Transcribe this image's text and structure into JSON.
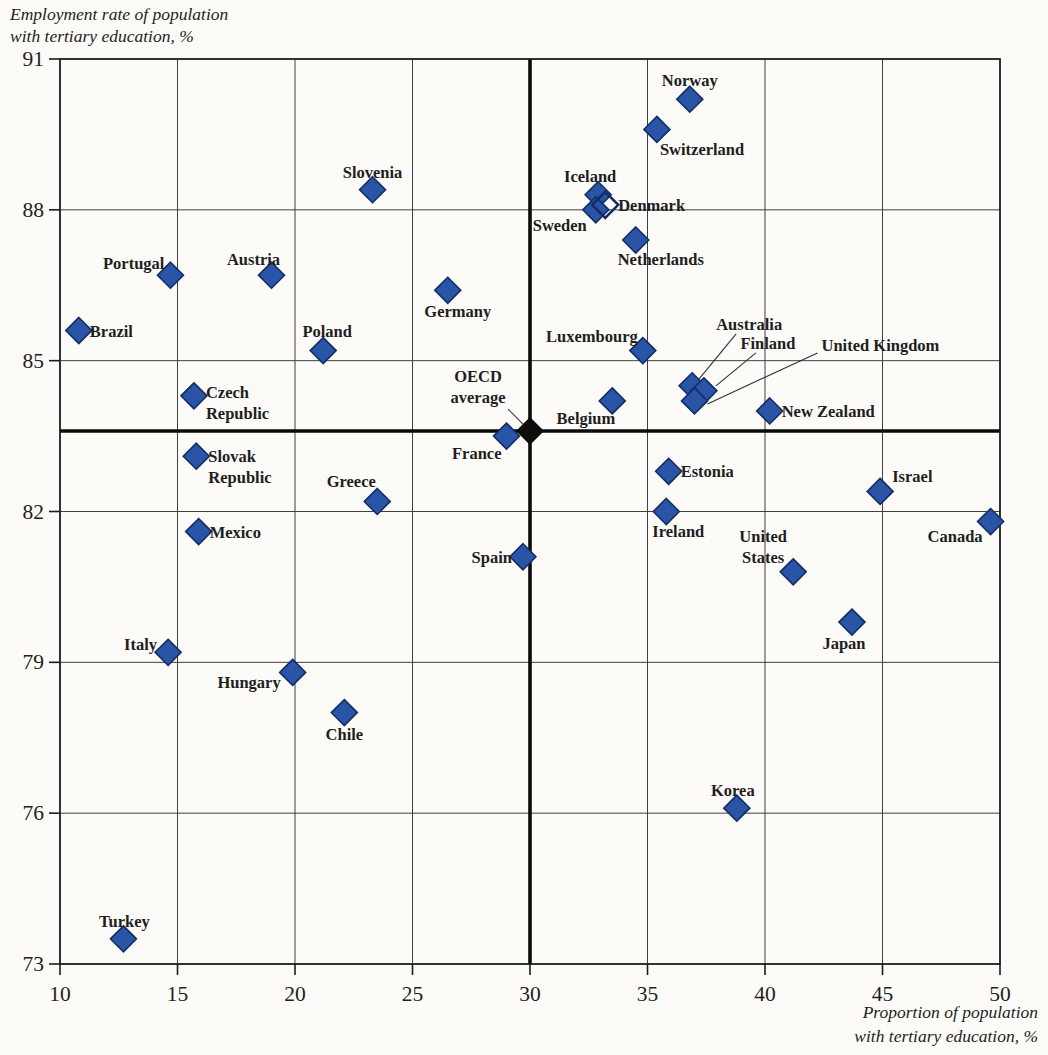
{
  "figure": {
    "background": "#fcfbf7"
  },
  "chart_data": {
    "type": "scatter",
    "title": "",
    "xlabel": "Proportion of population with tertiary education, %",
    "ylabel": "Employment rate of population with tertiary education, %",
    "x_axis_title_lines": [
      "Proportion of population",
      "with tertiary education, %"
    ],
    "y_axis_title_lines": [
      "Employment rate of population",
      "with tertiary education, %"
    ],
    "xlim": [
      10,
      50
    ],
    "ylim": [
      73,
      91
    ],
    "x_ticks": [
      10,
      15,
      20,
      25,
      30,
      35,
      40,
      45,
      50
    ],
    "y_ticks": [
      73,
      76,
      79,
      82,
      85,
      88,
      91
    ],
    "grid": true,
    "legend": "none",
    "reference_point": {
      "name": "OECD average",
      "x": 30,
      "y": 83.6,
      "marker": "black",
      "label": {
        "lines": [
          "OECD",
          "average"
        ],
        "anchor": "middle",
        "dx": -52,
        "dy": -49,
        "bold": true
      },
      "leader": [
        [
          -22,
          -22
        ],
        [
          -5,
          -5
        ]
      ]
    },
    "points": [
      {
        "name": "Brazil",
        "x": 10.8,
        "y": 85.6,
        "marker": "filled",
        "label": {
          "lines": [
            "Brazil"
          ],
          "anchor": "start",
          "dx": 11,
          "dy": 6
        }
      },
      {
        "name": "Turkey",
        "x": 12.7,
        "y": 73.5,
        "marker": "filled",
        "label": {
          "lines": [
            "Turkey"
          ],
          "anchor": "middle",
          "dx": 1,
          "dy": -12
        }
      },
      {
        "name": "Italy",
        "x": 14.6,
        "y": 79.2,
        "marker": "filled",
        "label": {
          "lines": [
            "Italy"
          ],
          "anchor": "end",
          "dx": -11,
          "dy": -2
        }
      },
      {
        "name": "Portugal",
        "x": 14.7,
        "y": 86.7,
        "marker": "filled",
        "label": {
          "lines": [
            "Portugal"
          ],
          "anchor": "end",
          "dx": -6,
          "dy": -6
        }
      },
      {
        "name": "Czech Republic",
        "x": 15.7,
        "y": 84.3,
        "marker": "filled",
        "label": {
          "lines": [
            "Czech",
            "Republic"
          ],
          "anchor": "start",
          "dx": 12,
          "dy": 2
        }
      },
      {
        "name": "Slovak Republic",
        "x": 15.8,
        "y": 83.1,
        "marker": "filled",
        "label": {
          "lines": [
            "Slovak",
            "Republic"
          ],
          "anchor": "start",
          "dx": 12,
          "dy": 6
        }
      },
      {
        "name": "Mexico",
        "x": 15.9,
        "y": 81.6,
        "marker": "filled",
        "label": {
          "lines": [
            "Mexico"
          ],
          "anchor": "start",
          "dx": 11,
          "dy": 6
        }
      },
      {
        "name": "Austria",
        "x": 19.0,
        "y": 86.7,
        "marker": "filled",
        "label": {
          "lines": [
            "Austria"
          ],
          "anchor": "middle",
          "dx": -18,
          "dy": -10
        }
      },
      {
        "name": "Hungary",
        "x": 19.9,
        "y": 78.8,
        "marker": "filled",
        "label": {
          "lines": [
            "Hungary"
          ],
          "anchor": "end",
          "dx": -12,
          "dy": 16
        }
      },
      {
        "name": "Poland",
        "x": 21.2,
        "y": 85.2,
        "marker": "filled",
        "label": {
          "lines": [
            "Poland"
          ],
          "anchor": "middle",
          "dx": 4,
          "dy": -14
        }
      },
      {
        "name": "Chile",
        "x": 22.1,
        "y": 78.0,
        "marker": "filled",
        "label": {
          "lines": [
            "Chile"
          ],
          "anchor": "middle",
          "dx": 0,
          "dy": 27
        }
      },
      {
        "name": "Slovenia",
        "x": 23.3,
        "y": 88.4,
        "marker": "filled",
        "label": {
          "lines": [
            "Slovenia"
          ],
          "anchor": "middle",
          "dx": 0,
          "dy": -12
        }
      },
      {
        "name": "Greece",
        "x": 23.5,
        "y": 82.2,
        "marker": "filled",
        "label": {
          "lines": [
            "Greece"
          ],
          "anchor": "middle",
          "dx": -26,
          "dy": -14
        }
      },
      {
        "name": "Germany",
        "x": 26.5,
        "y": 86.4,
        "marker": "filled",
        "label": {
          "lines": [
            "Germany"
          ],
          "anchor": "middle",
          "dx": 10,
          "dy": 27
        }
      },
      {
        "name": "France",
        "x": 29.0,
        "y": 83.5,
        "marker": "filled",
        "label": {
          "lines": [
            "France"
          ],
          "anchor": "end",
          "dx": -5,
          "dy": 23
        }
      },
      {
        "name": "Spain",
        "x": 29.7,
        "y": 81.1,
        "marker": "filled",
        "label": {
          "lines": [
            "Spain"
          ],
          "anchor": "end",
          "dx": -11,
          "dy": 6
        }
      },
      {
        "name": "Iceland",
        "x": 32.9,
        "y": 88.3,
        "marker": "filled",
        "label": {
          "lines": [
            "Iceland"
          ],
          "anchor": "middle",
          "dx": -8,
          "dy": -13
        }
      },
      {
        "name": "Sweden",
        "x": 32.8,
        "y": 88.0,
        "marker": "filled",
        "label": {
          "lines": [
            "Sweden"
          ],
          "anchor": "end",
          "dx": -9,
          "dy": 21
        }
      },
      {
        "name": "Denmark",
        "x": 33.2,
        "y": 88.1,
        "marker": "open",
        "label": {
          "lines": [
            "Denmark"
          ],
          "anchor": "start",
          "dx": 13,
          "dy": 6
        }
      },
      {
        "name": "Belgium",
        "x": 33.5,
        "y": 84.2,
        "marker": "filled",
        "label": {
          "lines": [
            "Belgium"
          ],
          "anchor": "end",
          "dx": 3,
          "dy": 23
        }
      },
      {
        "name": "Netherlands",
        "x": 34.5,
        "y": 87.4,
        "marker": "filled",
        "label": {
          "lines": [
            "Netherlands"
          ],
          "anchor": "middle",
          "dx": 25,
          "dy": 25
        }
      },
      {
        "name": "Luxembourg",
        "x": 34.8,
        "y": 85.2,
        "marker": "filled",
        "label": {
          "lines": [
            "Luxembourg"
          ],
          "anchor": "end",
          "dx": -5,
          "dy": -9
        }
      },
      {
        "name": "Switzerland",
        "x": 35.4,
        "y": 89.6,
        "marker": "filled",
        "label": {
          "lines": [
            "Switzerland"
          ],
          "anchor": "start",
          "dx": 3,
          "dy": 26
        }
      },
      {
        "name": "Estonia",
        "x": 35.9,
        "y": 82.8,
        "marker": "filled",
        "label": {
          "lines": [
            "Estonia"
          ],
          "anchor": "start",
          "dx": 12,
          "dy": 6
        }
      },
      {
        "name": "Ireland",
        "x": 35.8,
        "y": 82.0,
        "marker": "filled",
        "label": {
          "lines": [
            "Ireland"
          ],
          "anchor": "middle",
          "dx": 12,
          "dy": 25
        }
      },
      {
        "name": "Norway",
        "x": 36.8,
        "y": 90.2,
        "marker": "filled",
        "label": {
          "lines": [
            "Norway"
          ],
          "anchor": "middle",
          "dx": 0,
          "dy": -13
        }
      },
      {
        "name": "Australia",
        "x": 36.9,
        "y": 84.5,
        "marker": "filled",
        "label": {
          "lines": [
            "Australia"
          ],
          "anchor": "middle",
          "dx": 57,
          "dy": -56
        },
        "leader": [
          [
            44,
            -52
          ],
          [
            7,
            -7
          ]
        ]
      },
      {
        "name": "Finland",
        "x": 37.4,
        "y": 84.4,
        "marker": "filled",
        "label": {
          "lines": [
            "Finland"
          ],
          "anchor": "middle",
          "dx": 64,
          "dy": -42
        },
        "leader": [
          [
            52,
            -38
          ],
          [
            12,
            -5
          ]
        ]
      },
      {
        "name": "United Kingdom",
        "x": 37.0,
        "y": 84.2,
        "marker": "filled",
        "label": {
          "lines": [
            "United Kingdom"
          ],
          "anchor": "start",
          "dx": 127,
          "dy": -50
        },
        "leader": [
          [
            123,
            -48
          ],
          [
            13,
            3
          ]
        ]
      },
      {
        "name": "Korea",
        "x": 38.8,
        "y": 76.1,
        "marker": "filled",
        "label": {
          "lines": [
            "Korea"
          ],
          "anchor": "middle",
          "dx": -4,
          "dy": -12
        }
      },
      {
        "name": "New Zealand",
        "x": 40.2,
        "y": 84.0,
        "marker": "filled",
        "label": {
          "lines": [
            "New Zealand"
          ],
          "anchor": "start",
          "dx": 12,
          "dy": 6
        }
      },
      {
        "name": "United States",
        "x": 41.2,
        "y": 80.8,
        "marker": "filled",
        "label": {
          "lines": [
            "United",
            "States"
          ],
          "anchor": "middle",
          "dx": -30,
          "dy": -30
        }
      },
      {
        "name": "Israel",
        "x": 44.9,
        "y": 82.4,
        "marker": "filled",
        "label": {
          "lines": [
            "Israel"
          ],
          "anchor": "start",
          "dx": 12,
          "dy": -9
        }
      },
      {
        "name": "Japan",
        "x": 43.7,
        "y": 79.8,
        "marker": "filled",
        "label": {
          "lines": [
            "Japan"
          ],
          "anchor": "middle",
          "dx": -8,
          "dy": 27
        }
      },
      {
        "name": "Canada",
        "x": 49.6,
        "y": 81.8,
        "marker": "filled",
        "label": {
          "lines": [
            "Canada"
          ],
          "anchor": "end",
          "dx": -8,
          "dy": 20
        }
      }
    ]
  },
  "style": {
    "marker_fill": "#2a54a6",
    "marker_stroke": "#132d66",
    "open_marker_stroke": "#132d66",
    "reference_marker_fill": "#0d0d0d",
    "grid_color": "#3f3f3f",
    "border_color": "#1c1c1c",
    "thick_line_color": "#0a0a0a",
    "text_color": "#221e1f",
    "leader_line_color": "#333333",
    "background": "#fcfbf7"
  }
}
